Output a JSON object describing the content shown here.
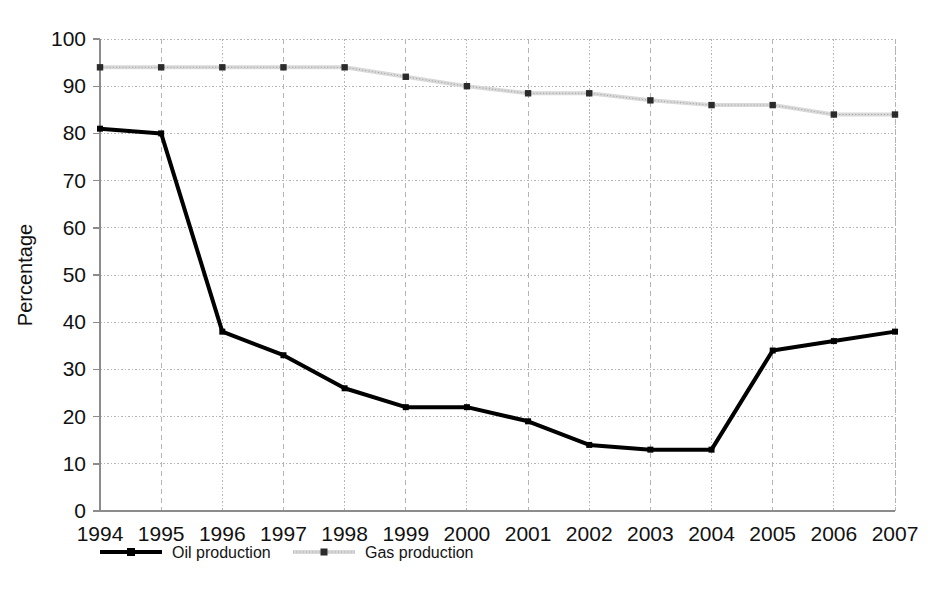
{
  "chart_data": {
    "type": "line",
    "title": "",
    "xlabel": "",
    "ylabel": "Percentage",
    "categories": [
      "1994",
      "1995",
      "1996",
      "1997",
      "1998",
      "1999",
      "2000",
      "2001",
      "2002",
      "2003",
      "2004",
      "2005",
      "2006",
      "2007"
    ],
    "x": [
      1994,
      1995,
      1996,
      1997,
      1998,
      1999,
      2000,
      2001,
      2002,
      2003,
      2004,
      2005,
      2006,
      2007
    ],
    "ylim": [
      0,
      100
    ],
    "xlim": [
      1994,
      2007
    ],
    "yticks": [
      0,
      10,
      20,
      30,
      40,
      50,
      60,
      70,
      80,
      90,
      100
    ],
    "ytick_labels": [
      "0",
      "10",
      "20",
      "30",
      "40",
      "50",
      "60",
      "70",
      "80",
      "90",
      "100"
    ],
    "grid": true,
    "grid_style": "dotted",
    "legend_position": "bottom-left",
    "series": [
      {
        "name": "Oil production",
        "color": "#000000",
        "line_style": "solid",
        "line_width": 4,
        "marker": "square",
        "values": [
          81,
          80,
          38,
          33,
          26,
          22,
          22,
          19,
          14,
          13,
          13,
          34,
          36,
          38
        ]
      },
      {
        "name": "Gas production",
        "color": "#d9d9d9",
        "line_style": "dotted",
        "line_width": 4,
        "marker": "square",
        "marker_color": "#2b2b2b",
        "values": [
          94,
          94,
          94,
          94,
          94,
          92,
          90,
          88.5,
          88.5,
          87,
          86,
          86,
          84,
          84
        ]
      }
    ]
  },
  "axis": {
    "y_label": "Percentage"
  },
  "legend": {
    "items": [
      {
        "label": "Oil production",
        "swatch": "oil-line-swatch"
      },
      {
        "label": "Gas production",
        "swatch": "gas-line-swatch"
      }
    ]
  },
  "colors": {
    "oil": "#000000",
    "gas": "#d9d9d9",
    "gas_marker": "#2b2b2b",
    "grid": "#b4b4b4",
    "axis": "#8c8c8c",
    "text": "#111111",
    "background": "#ffffff"
  }
}
